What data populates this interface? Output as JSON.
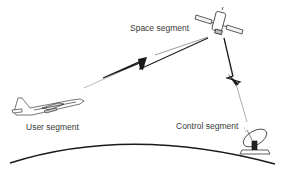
{
  "diagram": {
    "type": "satellite-system-segments",
    "nodes": [
      {
        "id": "space",
        "label": "Space segment",
        "icon": "satellite-icon"
      },
      {
        "id": "user",
        "label": "User segment",
        "icon": "airplane-icon"
      },
      {
        "id": "control",
        "label": "Control segment",
        "icon": "ground-antenna-icon"
      }
    ],
    "links": [
      {
        "from": "user",
        "to": "space",
        "style": "lightning-bolt"
      },
      {
        "from": "control",
        "to": "space",
        "style": "lightning-bolt"
      }
    ],
    "background": "earth-horizon-curve"
  },
  "colors": {
    "stroke": "#1a1a1a",
    "text": "#3a3a3a",
    "background": "#ffffff"
  }
}
